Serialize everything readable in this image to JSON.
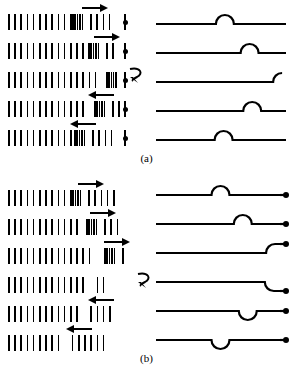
{
  "figure": {
    "ink_color": "#000000",
    "background_color": "#ffffff"
  },
  "panels": [
    {
      "id": "a",
      "caption": "(a)",
      "end_type": "fixed",
      "end_marker": "tick-with-dot",
      "rows": [
        {
          "index": 0,
          "arrow": {
            "direction": "right",
            "x": 74,
            "width": 26
          },
          "compression": {
            "start": 64,
            "count": 5,
            "spacing": 2.4
          },
          "pulse": {
            "shape": "bump",
            "orientation": "up",
            "center_pct": 53,
            "clipped": "none"
          },
          "ticks_spread_left": 11,
          "ticks_spread_right": 4
        },
        {
          "index": 1,
          "arrow": {
            "direction": "right",
            "x": 86,
            "width": 26
          },
          "compression": {
            "start": 80,
            "count": 5,
            "spacing": 2.4
          },
          "pulse": {
            "shape": "bump",
            "orientation": "up",
            "center_pct": 72,
            "clipped": "none"
          },
          "ticks_spread_left": 13,
          "ticks_spread_right": 2
        },
        {
          "index": 2,
          "arrow": {
            "direction": "none",
            "x": 0,
            "width": 0
          },
          "compression": {
            "start": 98,
            "count": 5,
            "spacing": 2.3
          },
          "pulse": {
            "shape": "half-bump",
            "orientation": "up",
            "center_pct": 97,
            "clipped": "right"
          },
          "ticks_spread_left": 15,
          "ticks_spread_right": 0,
          "reflection_arrow": true
        },
        {
          "index": 3,
          "arrow": {
            "direction": "left",
            "x": 80,
            "width": 26
          },
          "compression": {
            "start": 86,
            "count": 5,
            "spacing": 2.4
          },
          "pulse": {
            "shape": "bump",
            "orientation": "up",
            "center_pct": 74,
            "clipped": "none"
          },
          "ticks_spread_left": 13,
          "ticks_spread_right": 2
        },
        {
          "index": 4,
          "arrow": {
            "direction": "left",
            "x": 62,
            "width": 26
          },
          "compression": {
            "start": 66,
            "count": 5,
            "spacing": 2.4
          },
          "pulse": {
            "shape": "bump",
            "orientation": "up",
            "center_pct": 52,
            "clipped": "none"
          },
          "ticks_spread_left": 11,
          "ticks_spread_right": 4
        }
      ]
    },
    {
      "id": "b",
      "caption": "(b)",
      "end_type": "free",
      "end_marker": "dot-on-stub",
      "rows": [
        {
          "index": 0,
          "arrow": {
            "direction": "right",
            "x": 70,
            "width": 26
          },
          "compression": {
            "start": 62,
            "count": 5,
            "spacing": 2.4
          },
          "pulse": {
            "shape": "bump",
            "orientation": "up",
            "center_pct": 52,
            "clipped": "none"
          },
          "ticks_spread_left": 10,
          "ticks_spread_right": 5
        },
        {
          "index": 1,
          "arrow": {
            "direction": "right",
            "x": 82,
            "width": 26
          },
          "compression": {
            "start": 78,
            "count": 5,
            "spacing": 2.4
          },
          "pulse": {
            "shape": "bump",
            "orientation": "up",
            "center_pct": 70,
            "clipped": "none"
          },
          "ticks_spread_left": 12,
          "ticks_spread_right": 3
        },
        {
          "index": 2,
          "arrow": {
            "direction": "right",
            "x": 96,
            "width": 26
          },
          "compression": {
            "start": 96,
            "count": 5,
            "spacing": 2.4
          },
          "pulse": {
            "shape": "half-bump",
            "orientation": "up",
            "center_pct": 96,
            "clipped": "right"
          },
          "ticks_spread_left": 14,
          "ticks_spread_right": 1
        },
        {
          "index": 3,
          "arrow": {
            "direction": "none",
            "x": 0,
            "width": 0
          },
          "compression": null,
          "rarefaction": {
            "gap_after": 13
          },
          "pulse": {
            "shape": "half-bump",
            "orientation": "down",
            "center_pct": 95,
            "clipped": "right"
          },
          "ticks_spread_left": 13,
          "ticks_spread_right": 1,
          "reflection_arrow": true
        },
        {
          "index": 4,
          "arrow": {
            "direction": "left",
            "x": 80,
            "width": 26
          },
          "rarefaction": {
            "gap_after": 12
          },
          "pulse": {
            "shape": "bump",
            "orientation": "down",
            "center_pct": 74,
            "clipped": "none"
          },
          "ticks_spread_left": 12,
          "ticks_spread_right": 3
        },
        {
          "index": 5,
          "arrow": {
            "direction": "left",
            "x": 58,
            "width": 26
          },
          "rarefaction": {
            "gap_after": 9
          },
          "pulse": {
            "shape": "bump",
            "orientation": "down",
            "center_pct": 52,
            "clipped": "none"
          },
          "ticks_spread_left": 9,
          "ticks_spread_right": 5
        }
      ]
    }
  ]
}
